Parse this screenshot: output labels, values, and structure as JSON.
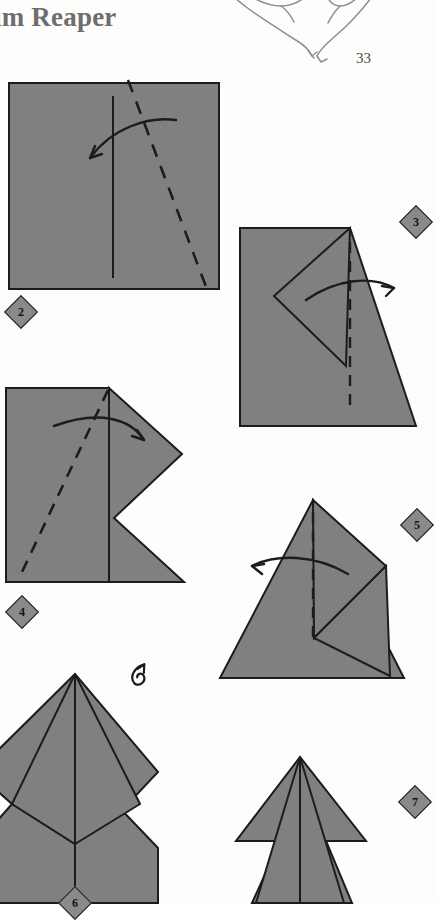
{
  "page": {
    "title": "im Reaper",
    "folio": "33",
    "background_color": "#fdfdfc",
    "paper_fill": "#808080",
    "ink_color": "#1c1c1c",
    "title_color": "#6e6e6e",
    "decorative_art": "bat-silhouette-outline"
  },
  "legend": {
    "solid_line": "existing crease / edge",
    "dashed_line": "valley fold line",
    "curved_arrow": "fold direction",
    "loop_arrow": "turn model over"
  },
  "steps": [
    {
      "number": "2",
      "shape": "square",
      "badge_label": "2",
      "fold_lines": [
        "vertical-crease-solid",
        "diagonal-dashed"
      ],
      "arrow": "curved-arrow-left"
    },
    {
      "number": "3",
      "shape": "folded-flap-right",
      "badge_label": "3",
      "fold_lines": [
        "vertical-dashed"
      ],
      "arrow": "curved-arrow-right"
    },
    {
      "number": "4",
      "shape": "arrow-point-right",
      "badge_label": "4",
      "fold_lines": [
        "diagonal-dashed",
        "vertical-solid"
      ],
      "arrow": "curved-arrow-right"
    },
    {
      "number": "5",
      "shape": "kite-triangle",
      "badge_label": "5",
      "fold_lines": [
        "vertical-dashed"
      ],
      "arrow": "curved-arrow-left"
    },
    {
      "number": "6",
      "shape": "symmetric-diamond-body",
      "badge_label": "6",
      "fold_lines": [
        "vertical-center-solid"
      ],
      "arrow": "turn-over-symbol"
    },
    {
      "number": "7",
      "shape": "narrow-pointed-figure",
      "badge_label": "7",
      "fold_lines": [
        "vertical-center-solid"
      ],
      "arrow": "none"
    }
  ]
}
